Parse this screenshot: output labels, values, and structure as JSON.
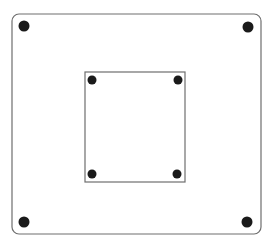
{
  "diagram": {
    "stroke_color": "#6e6e6e",
    "dot_color": "#1a1a1a",
    "outer_rect": {
      "x": 12,
      "y": 14,
      "width": 249,
      "height": 220,
      "corner_radius": 7
    },
    "inner_rect": {
      "x": 85,
      "y": 72,
      "width": 100,
      "height": 110,
      "corner_radius": 0
    },
    "outer_dots": [
      {
        "cx": 24,
        "cy": 26,
        "r": 5.5
      },
      {
        "cx": 248,
        "cy": 27,
        "r": 5.5
      },
      {
        "cx": 24,
        "cy": 222,
        "r": 5.5
      },
      {
        "cx": 247,
        "cy": 222,
        "r": 5.5
      }
    ],
    "inner_dots": [
      {
        "cx": 92,
        "cy": 80,
        "r": 4.5
      },
      {
        "cx": 178,
        "cy": 80,
        "r": 4.5
      },
      {
        "cx": 92,
        "cy": 174,
        "r": 4.5
      },
      {
        "cx": 177,
        "cy": 174,
        "r": 4.5
      }
    ]
  }
}
